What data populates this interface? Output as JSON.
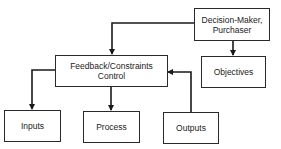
{
  "diagram": {
    "nodes": {
      "decision_maker": {
        "line1": "Decision-Maker,",
        "line2": "Purchaser"
      },
      "objectives": {
        "label": "Objectives"
      },
      "feedback": {
        "line1": "Feedback/Constraints",
        "line2": "Control"
      },
      "inputs": {
        "label": "Inputs"
      },
      "process": {
        "label": "Process"
      },
      "outputs": {
        "label": "Outputs"
      }
    },
    "edges": [
      {
        "from": "Decision-Maker, Purchaser",
        "to": "Feedback/Constraints Control"
      },
      {
        "from": "Decision-Maker, Purchaser",
        "to": "Objectives"
      },
      {
        "from": "Feedback/Constraints Control",
        "to": "Inputs"
      },
      {
        "from": "Feedback/Constraints Control",
        "to": "Process"
      },
      {
        "from": "Outputs",
        "to": "Feedback/Constraints Control"
      }
    ],
    "colors": {
      "line": "#1a1a1a",
      "text": "#222222",
      "background": "#ffffff"
    }
  }
}
